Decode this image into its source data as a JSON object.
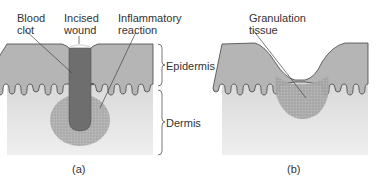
{
  "panel_a": {
    "labels": {
      "blood_clot": "Blood\nclot",
      "incised_wound": "Incised\nwound",
      "inflammatory_reaction": "Inflammatory\nreaction"
    },
    "caption": "(a)"
  },
  "panel_b": {
    "labels": {
      "granulation_tissue": "Granulation\ntissue"
    },
    "caption": "(b)"
  },
  "layers": {
    "epidermis": "Epidermis",
    "dermis": "Dermis"
  },
  "colors": {
    "epidermis": "#b3b3b3",
    "dermis_top": "#dcdcdc",
    "dermis_bottom": "#eeeeee",
    "clot": "#6f6f6f",
    "inflammation": "#9a9a9a",
    "line": "#555555"
  }
}
